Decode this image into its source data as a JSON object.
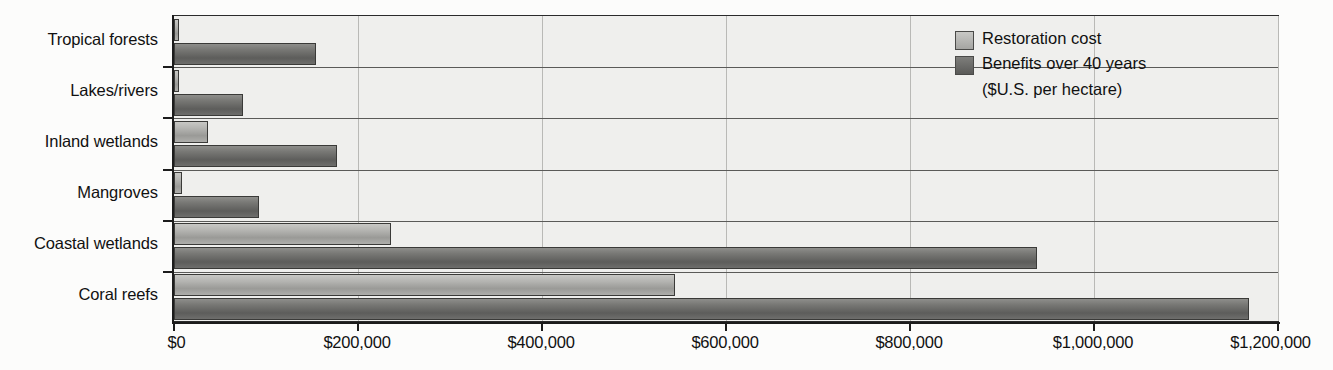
{
  "chart_data": {
    "type": "bar",
    "orientation": "horizontal",
    "title": "",
    "xlabel": "",
    "ylabel": "",
    "xlim": [
      0,
      1200000
    ],
    "xticks": [
      0,
      200000,
      400000,
      600000,
      800000,
      1000000,
      1200000
    ],
    "xtick_labels": [
      "$0",
      "$200,000",
      "$400,000",
      "$600,000",
      "$800,000",
      "$1,000,000",
      "$1,200,000"
    ],
    "grid": "vertical",
    "legend_position": "top-right",
    "categories": [
      "Tropical forests",
      "Lakes/rivers",
      "Inland wetlands",
      "Mangroves",
      "Coastal wetlands",
      "Coral reefs"
    ],
    "series": [
      {
        "name": "Restoration cost",
        "color": "#b4b4b1",
        "values": [
          3400,
          4000,
          37000,
          9000,
          236000,
          545000
        ]
      },
      {
        "name": "Benefits over 40 years",
        "color": "#6b6b69",
        "values": [
          154000,
          75000,
          177000,
          92000,
          938000,
          1169000
        ]
      }
    ],
    "units_note": "($U.S. per hectare)"
  },
  "legend": {
    "items": [
      {
        "label": "Restoration cost",
        "swatch": "cost"
      },
      {
        "label": "Benefits over 40 years",
        "swatch": "benefit"
      }
    ],
    "sub_label": "($U.S. per hectare)"
  }
}
